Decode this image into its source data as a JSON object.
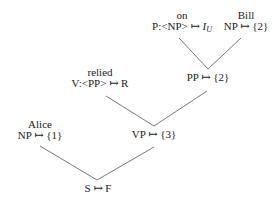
{
  "tree": {
    "nodes": {
      "on": {
        "word": "on",
        "category": "P:<NP> ↦ ",
        "value_main": "I",
        "value_sub": "U"
      },
      "bill": {
        "word": "Bill",
        "category": "NP ↦ {2}"
      },
      "pp": {
        "category": "PP ↦ {2}"
      },
      "relied": {
        "word": "relied",
        "category": "V:<PP> ↦ R"
      },
      "vp": {
        "category": "VP ↦ {3}"
      },
      "alice": {
        "word": "Alice",
        "category": "NP ↦ {1}"
      },
      "s": {
        "category": "S ↦ F"
      }
    },
    "edges": [
      [
        "on",
        "pp"
      ],
      [
        "bill",
        "pp"
      ],
      [
        "relied",
        "vp"
      ],
      [
        "pp",
        "vp"
      ],
      [
        "alice",
        "s"
      ],
      [
        "vp",
        "s"
      ]
    ]
  }
}
